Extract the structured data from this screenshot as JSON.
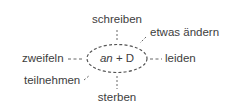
{
  "diagram": {
    "center": {
      "preposition": "an",
      "connector": " + ",
      "case": "D"
    },
    "verbs": [
      {
        "label": "schreiben",
        "position": "top"
      },
      {
        "label": "etwas ändern",
        "position": "top-right"
      },
      {
        "label": "zweifeln",
        "position": "left"
      },
      {
        "label": "leiden",
        "position": "right"
      },
      {
        "label": "teilnehmen",
        "position": "bottom-left"
      },
      {
        "label": "sterben",
        "position": "bottom"
      }
    ],
    "colors": {
      "text": "#3d3d3d",
      "line": "#555555",
      "background": "#ffffff"
    }
  }
}
